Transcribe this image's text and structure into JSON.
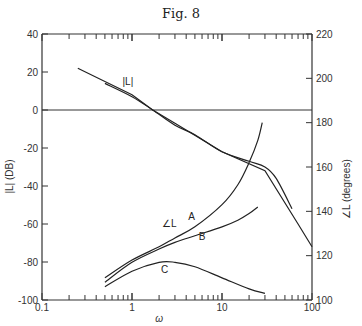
{
  "figure": {
    "title": "Fig. 8"
  },
  "chart_data": {
    "type": "line",
    "title": "Fig. 8",
    "xlabel": "ω",
    "ylabel_left": "|L| (DB)",
    "ylabel_right": "∠L (degrees)",
    "xscale": "log",
    "xlim": [
      0.1,
      100
    ],
    "ylim_left": [
      -100,
      40
    ],
    "ylim_right": [
      100,
      220
    ],
    "x_tick_labels": [
      "0.1",
      "1",
      "10",
      "100"
    ],
    "y_left_tick_labels": [
      "40",
      "20",
      "0",
      "-20",
      "-40",
      "-60",
      "-80",
      "-100"
    ],
    "y_right_tick_labels": [
      "220",
      "200",
      "180",
      "160",
      "140",
      "120",
      "100"
    ],
    "grid": false,
    "reference_line": {
      "axis": "left",
      "value": 0,
      "right_value": 180
    },
    "annotations": [
      "|L|",
      "∠L",
      "A",
      "B",
      "C"
    ],
    "series": [
      {
        "name": "|L| asymptote",
        "axis": "left",
        "x": [
          0.25,
          0.5,
          1,
          1.7,
          3,
          10,
          30,
          70,
          100
        ],
        "values": [
          22,
          15,
          8,
          0,
          -7,
          -22,
          -32,
          -60,
          -72
        ]
      },
      {
        "name": "|L|",
        "axis": "left",
        "x": [
          0.5,
          1,
          1.7,
          3,
          5,
          10,
          20,
          30,
          40,
          60
        ],
        "values": [
          14,
          7,
          0,
          -8,
          -13,
          -22,
          -27,
          -30,
          -36,
          -52
        ]
      },
      {
        "name": "C",
        "axis": "right",
        "x": [
          0.5,
          1,
          2,
          3,
          5,
          10,
          15,
          20,
          25,
          28
        ],
        "values": [
          110,
          118,
          124,
          128,
          133,
          143,
          152,
          162,
          172,
          180
        ]
      },
      {
        "name": "B",
        "axis": "right",
        "x": [
          0.5,
          1,
          2,
          3,
          5,
          10,
          15,
          20,
          25
        ],
        "values": [
          108,
          117,
          123,
          126,
          129,
          133,
          136,
          139,
          142
        ]
      },
      {
        "name": "A",
        "axis": "right",
        "x": [
          0.5,
          1,
          2,
          3,
          5,
          10,
          20,
          30
        ],
        "values": [
          106,
          113,
          117,
          117,
          115,
          110,
          105,
          103
        ]
      }
    ]
  }
}
